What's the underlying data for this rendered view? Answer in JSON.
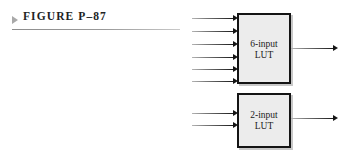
{
  "figure": {
    "marker_icon": "triangle-right-icon",
    "caption": "FIGURE P–87",
    "rule_color": "#9a9a9a"
  },
  "diagram": {
    "background": "#ffffff",
    "block_fill": "#ececec",
    "block_border": "#141414",
    "signal_color": "#1c1c1c",
    "blocks": [
      {
        "id": "6-input-lut",
        "label_line1": "6-input",
        "label_line2": "LUT",
        "input_count": 6,
        "output_count": 1
      },
      {
        "id": "2-input-lut",
        "label_line1": "2-input",
        "label_line2": "LUT",
        "input_count": 2,
        "output_count": 1
      }
    ]
  }
}
